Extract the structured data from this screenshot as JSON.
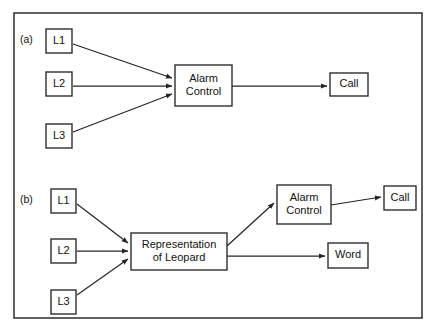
{
  "figure": {
    "background_color": "#ffffff",
    "frame_color": "#3a3a3a",
    "line_color": "#262626",
    "box_fill": "#ffffff",
    "box_stroke": "#2e2e2e",
    "panels": [
      {
        "label": "(a)",
        "label_x": 20,
        "label_y": 40,
        "nodes": [
          {
            "id": "a-l1",
            "name": "input-node-l1",
            "text": [
              "L1"
            ],
            "x": 46,
            "y": 29,
            "w": 26,
            "h": 24
          },
          {
            "id": "a-l2",
            "name": "input-node-l2",
            "text": [
              "L2"
            ],
            "x": 46,
            "y": 72,
            "w": 26,
            "h": 24
          },
          {
            "id": "a-l3",
            "name": "input-node-l3",
            "text": [
              "L3"
            ],
            "x": 46,
            "y": 124,
            "w": 26,
            "h": 24
          },
          {
            "id": "a-alarm",
            "name": "alarm-control-node",
            "text": [
              "Alarm",
              "Control"
            ],
            "x": 175,
            "y": 65,
            "w": 57,
            "h": 41
          },
          {
            "id": "a-call",
            "name": "call-node",
            "text": [
              "Call"
            ],
            "x": 330,
            "y": 73,
            "w": 38,
            "h": 23
          }
        ],
        "edges": [
          {
            "name": "edge-l1-to-alarm",
            "from": "a-l1",
            "to": "a-alarm",
            "x1": 73,
            "y1": 44,
            "x2": 172,
            "y2": 78
          },
          {
            "name": "edge-l2-to-alarm",
            "from": "a-l2",
            "to": "a-alarm",
            "x1": 73,
            "y1": 86,
            "x2": 172,
            "y2": 86
          },
          {
            "name": "edge-l3-to-alarm",
            "from": "a-l3",
            "to": "a-alarm",
            "x1": 73,
            "y1": 132,
            "x2": 172,
            "y2": 94
          },
          {
            "name": "edge-alarm-to-call",
            "from": "a-alarm",
            "to": "a-call",
            "x1": 232,
            "y1": 86,
            "x2": 327,
            "y2": 86
          }
        ]
      },
      {
        "label": "(b)",
        "label_x": 20,
        "label_y": 200,
        "nodes": [
          {
            "id": "b-l1",
            "name": "input-node-l1",
            "text": [
              "L1"
            ],
            "x": 51,
            "y": 189,
            "w": 25,
            "h": 24
          },
          {
            "id": "b-l2",
            "name": "input-node-l2",
            "text": [
              "L2"
            ],
            "x": 51,
            "y": 239,
            "w": 25,
            "h": 24
          },
          {
            "id": "b-l3",
            "name": "input-node-l3",
            "text": [
              "L3"
            ],
            "x": 51,
            "y": 290,
            "w": 25,
            "h": 24
          },
          {
            "id": "b-rep",
            "name": "representation-of-leopard-node",
            "text": [
              "Representation",
              "of Leopard"
            ],
            "x": 131,
            "y": 233,
            "w": 96,
            "h": 37
          },
          {
            "id": "b-alarm",
            "name": "alarm-control-node",
            "text": [
              "Alarm",
              "Control"
            ],
            "x": 277,
            "y": 185,
            "w": 54,
            "h": 39
          },
          {
            "id": "b-call",
            "name": "call-node",
            "text": [
              "Call"
            ],
            "x": 384,
            "y": 186,
            "w": 32,
            "h": 24
          },
          {
            "id": "b-word",
            "name": "word-node",
            "text": [
              "Word"
            ],
            "x": 328,
            "y": 243,
            "w": 40,
            "h": 25
          }
        ],
        "edges": [
          {
            "name": "edge-l1-to-representation",
            "from": "b-l1",
            "to": "b-rep",
            "x1": 77,
            "y1": 204,
            "x2": 128,
            "y2": 243
          },
          {
            "name": "edge-l2-to-representation",
            "from": "b-l2",
            "to": "b-rep",
            "x1": 77,
            "y1": 251,
            "x2": 128,
            "y2": 251
          },
          {
            "name": "edge-l3-to-representation",
            "from": "b-l3",
            "to": "b-rep",
            "x1": 77,
            "y1": 295,
            "x2": 128,
            "y2": 259
          },
          {
            "name": "edge-representation-to-alarm",
            "from": "b-rep",
            "to": "b-alarm",
            "x1": 227,
            "y1": 246,
            "x2": 274,
            "y2": 203
          },
          {
            "name": "edge-alarm-to-call",
            "from": "b-alarm",
            "to": "b-call",
            "x1": 331,
            "y1": 205,
            "x2": 381,
            "y2": 197
          },
          {
            "name": "edge-representation-to-word",
            "from": "b-rep",
            "to": "b-word",
            "x1": 227,
            "y1": 256,
            "x2": 325,
            "y2": 256
          }
        ]
      }
    ],
    "frame": {
      "x": 14,
      "y": 13,
      "w": 408,
      "h": 305
    }
  }
}
